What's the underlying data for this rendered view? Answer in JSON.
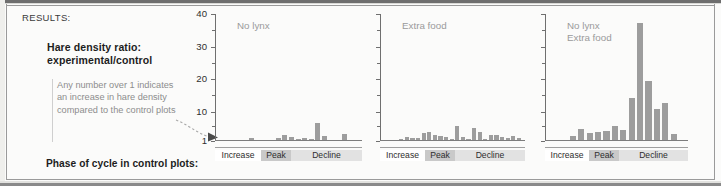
{
  "figure": {
    "results_label": "RESULTS:",
    "heading": "Hare density ratio:\nexperimental/control",
    "note": "Any number over 1 indicates an increase in hare density compared to the control plots",
    "phase_axis_title": "Phase of cycle in control plots:"
  },
  "colors": {
    "bar": "#9d9d9d",
    "axis": "#6f6f6f",
    "note_text": "#8d8d8d",
    "chart_title": "#9a9a9a",
    "peak_band": "#c9c9c9",
    "decline_band": "#e2e2e2",
    "increase_band": "#ffffff",
    "page_background": "#fbfbfa"
  },
  "axis": {
    "y_tick_labels": [
      "40",
      "30",
      "20",
      "10",
      "1"
    ],
    "y_tick_values": [
      40,
      30,
      20,
      10,
      1
    ],
    "y_minor_count": 4
  },
  "phases": [
    {
      "label": "Increase",
      "shade": "none"
    },
    {
      "label": "Peak",
      "shade": "dark"
    },
    {
      "label": "Decline",
      "shade": "light"
    }
  ],
  "chart_data": [
    {
      "type": "bar",
      "title": "No lynx",
      "ylabel": "Hare density ratio: experimental/control",
      "xlabel": "Phase of cycle in control plots",
      "ylim": [
        0,
        40
      ],
      "ytick_labels": [
        "1",
        "10",
        "20",
        "30",
        "40"
      ],
      "grid": false,
      "categories": [
        "Increase",
        "Peak",
        "Decline"
      ],
      "values": [
        1.0,
        1.0,
        1.05,
        1.1,
        1.6,
        1.0,
        1.0,
        1.0,
        1.5,
        2.6,
        2.0,
        1.3,
        1.5,
        1.3,
        6.3,
        2.2,
        1.1,
        1.1,
        3.0,
        1.1,
        1.0
      ],
      "annotation": "Any number over 1 indicates an increase in hare density compared to the control plots"
    },
    {
      "type": "bar",
      "title": "Extra food",
      "ylim": [
        0,
        40
      ],
      "grid": false,
      "categories": [
        "Increase",
        "Peak",
        "Decline"
      ],
      "values": [
        1.0,
        1.1,
        1.2,
        1.9,
        1.6,
        1.5,
        3.2,
        3.5,
        2.4,
        2.2,
        1.8,
        1.2,
        5.3,
        1.9,
        1.3,
        4.6,
        3.6,
        1.3,
        2.5,
        2.4,
        1.8,
        1.5,
        2.3,
        1.6,
        1.1
      ]
    },
    {
      "type": "bar",
      "title": "No lynx\nExtra food",
      "ylim": [
        0,
        40
      ],
      "grid": false,
      "categories": [
        "Increase",
        "Peak",
        "Decline"
      ],
      "values": [
        1.0,
        1.0,
        2.1,
        4.4,
        3.1,
        3.5,
        3.9,
        5.3,
        4.0,
        14.0,
        37.0,
        19.0,
        10.5,
        12.5,
        3.0
      ],
      "max_value": 37
    }
  ]
}
